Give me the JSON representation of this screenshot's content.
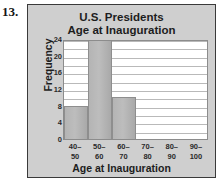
{
  "problem_number": "13.",
  "chart_data": {
    "type": "bar",
    "title": "U.S. Presidents Age at Inauguration",
    "title_lines": [
      "U.S. Presidents",
      "Age at Inauguration"
    ],
    "xlabel": "Age at Inauguration",
    "ylabel": "Frequency",
    "categories": [
      "40-50",
      "50-60",
      "60-70",
      "70-80",
      "80-90",
      "90-100"
    ],
    "category_lines": [
      [
        "40–",
        "50"
      ],
      [
        "50–",
        "60"
      ],
      [
        "60–",
        "70"
      ],
      [
        "70–",
        "80"
      ],
      [
        "80–",
        "90"
      ],
      [
        "90–",
        "100"
      ]
    ],
    "values": [
      8,
      24,
      10,
      0,
      0,
      0
    ],
    "ylim": [
      0,
      24
    ],
    "ytick_labels": [
      "0",
      "4",
      "8",
      "12",
      "16",
      "20",
      "24"
    ],
    "ytick_values": [
      0,
      4,
      8,
      12,
      16,
      20,
      24
    ],
    "gridline_interval": 2,
    "grid": true,
    "legend": "none",
    "colors": {
      "panel_background": "#cfcfcf",
      "panel_border": "#3a3a3a",
      "plot_background": "#ffffff",
      "bar_fill": "#b4b4b4",
      "bar_border": "#8e8e8e",
      "gridline": "#b9b9b9",
      "text": "#1d1d1d"
    }
  }
}
